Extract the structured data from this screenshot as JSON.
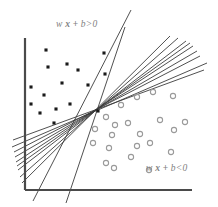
{
  "figure": {
    "labels": {
      "positive_region": {
        "text": "w x + b>0",
        "prefix": "w ",
        "variable": "x",
        "operator": " + ",
        "suffix": "b>0",
        "color": "#808080",
        "x": 56,
        "y": 20
      },
      "negative_region": {
        "text": "w x + b<0",
        "prefix": "w ",
        "variable": "x",
        "operator": " + ",
        "suffix": "b<0",
        "color": "#808080",
        "x": 146,
        "y": 164
      }
    }
  },
  "chart_data": {
    "type": "scatter",
    "title": "",
    "xlabel": "",
    "ylabel": "",
    "xlim": [
      0,
      218
    ],
    "ylim": [
      207,
      0
    ],
    "grid": false,
    "legend": "none",
    "axes": {
      "color": "#4a4a4a",
      "width": 2.2,
      "origin": [
        25,
        190
      ],
      "y_axis_top": [
        25,
        38
      ],
      "x_axis_right": [
        192,
        190
      ]
    },
    "series": [
      {
        "name": "class-positive",
        "marker": "filled-square-dot",
        "color": "#1a1a1a",
        "size": 3.1,
        "points": [
          [
            46,
            50
          ],
          [
            67,
            64
          ],
          [
            48,
            67
          ],
          [
            78,
            70
          ],
          [
            104,
            53
          ],
          [
            105,
            74
          ],
          [
            31,
            87
          ],
          [
            62,
            83
          ],
          [
            44,
            95
          ],
          [
            88,
            85
          ],
          [
            70,
            104
          ],
          [
            31,
            104
          ],
          [
            56,
            109
          ],
          [
            40,
            113
          ],
          [
            98,
            111
          ],
          [
            54,
            123
          ]
        ]
      },
      {
        "name": "class-negative",
        "marker": "open-circle",
        "color": "#9a9a9a",
        "size": 2.6,
        "points": [
          [
            121,
            105
          ],
          [
            137,
            97
          ],
          [
            153,
            92
          ],
          [
            173,
            96
          ],
          [
            106,
            117
          ],
          [
            115,
            125
          ],
          [
            128,
            123
          ],
          [
            112,
            135
          ],
          [
            109,
            148
          ],
          [
            140,
            134
          ],
          [
            137,
            146
          ],
          [
            150,
            143
          ],
          [
            160,
            120
          ],
          [
            174,
            130
          ],
          [
            185,
            122
          ],
          [
            131,
            157
          ],
          [
            114,
            168
          ],
          [
            106,
            163
          ],
          [
            149,
            170
          ],
          [
            171,
            152
          ],
          [
            95,
            129
          ],
          [
            93,
            143
          ]
        ]
      }
    ],
    "candidate_lines": {
      "name": "candidate-separating-hyperplanes",
      "color": "#3c3c3c",
      "width": 0.9,
      "count": 11,
      "pivot": [
        95,
        112
      ],
      "segments": [
        [
          13,
          140,
          204,
          70
        ],
        [
          14,
          152,
          200,
          56
        ],
        [
          16,
          162,
          193,
          46
        ],
        [
          18,
          170,
          186,
          41
        ],
        [
          20,
          177,
          178,
          38
        ],
        [
          22,
          183,
          170,
          36
        ],
        [
          12,
          147,
          207,
          63
        ],
        [
          15,
          157,
          197,
          51
        ],
        [
          17,
          166,
          190,
          43
        ],
        [
          33,
          201,
          131,
          10
        ],
        [
          66,
          203,
          125,
          27
        ]
      ]
    }
  }
}
